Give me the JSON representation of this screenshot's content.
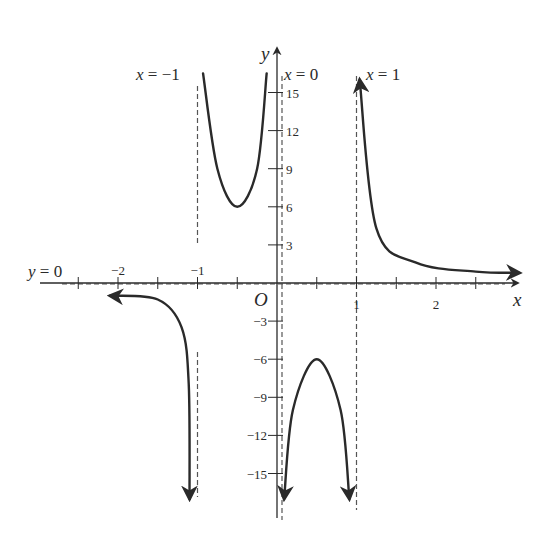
{
  "colors": {
    "background": "#ffffff",
    "ink": "#2a2a2a",
    "dashed": "#555555"
  },
  "chart_data": {
    "type": "line",
    "title": "",
    "xlabel": "x",
    "ylabel": "y",
    "origin_label": "O",
    "xlim": [
      -3.0,
      3.0
    ],
    "ylim": [
      -17,
      18
    ],
    "grid": false,
    "x_ticks": [
      -2.5,
      -2,
      -1.5,
      -1,
      -0.5,
      0.5,
      1,
      1.5,
      2,
      2.5
    ],
    "x_tick_labels": [
      {
        "value": -2,
        "label": "−2"
      },
      {
        "value": -1,
        "label": "−1"
      },
      {
        "value": 1,
        "label": "1"
      },
      {
        "value": 2,
        "label": "2"
      }
    ],
    "y_ticks": [
      15,
      12,
      9,
      6,
      3,
      -3,
      -6,
      -9,
      -12,
      -15
    ],
    "y_tick_labels": [
      {
        "value": 15,
        "label": "15"
      },
      {
        "value": 12,
        "label": "12"
      },
      {
        "value": 9,
        "label": "9"
      },
      {
        "value": 6,
        "label": "6"
      },
      {
        "value": 3,
        "label": "3"
      },
      {
        "value": -3,
        "label": "−3"
      },
      {
        "value": -6,
        "label": "−6"
      },
      {
        "value": -9,
        "label": "−9"
      },
      {
        "value": -12,
        "label": "−12"
      },
      {
        "value": -15,
        "label": "−15"
      }
    ],
    "asymptotes": [
      {
        "type": "vertical",
        "x": -1,
        "label_var": "x",
        "label_eq": " = −1"
      },
      {
        "type": "vertical",
        "x": 0,
        "label_var": "x",
        "label_eq": " = 0"
      },
      {
        "type": "vertical",
        "x": 1,
        "label_var": "x",
        "label_eq": " = 1"
      },
      {
        "type": "horizontal",
        "y": 0,
        "label_var": "y",
        "label_eq": " = 0"
      }
    ],
    "series": [
      {
        "name": "branch x < -1",
        "points": [
          [
            -2.1,
            -1.0
          ],
          [
            -1.5,
            -1.3
          ],
          [
            -1.2,
            -3.5
          ],
          [
            -1.11,
            -8
          ],
          [
            -1.1,
            -17
          ]
        ],
        "arrows": [
          "start",
          "end"
        ]
      },
      {
        "name": "branch -1 < x < 0",
        "points": [
          [
            -0.93,
            16.5
          ],
          [
            -0.75,
            9
          ],
          [
            -0.5,
            6
          ],
          [
            -0.25,
            9
          ],
          [
            -0.13,
            16.5
          ]
        ],
        "local_min": [
          -0.5,
          6
        ],
        "arrows": []
      },
      {
        "name": "branch 0 < x < 1",
        "points": [
          [
            0.09,
            -17
          ],
          [
            0.2,
            -10
          ],
          [
            0.5,
            -6
          ],
          [
            0.8,
            -10
          ],
          [
            0.91,
            -17
          ]
        ],
        "local_max": [
          0.5,
          -6
        ],
        "arrows": [
          "start",
          "end"
        ]
      },
      {
        "name": "branch x > 1",
        "points": [
          [
            1.04,
            16
          ],
          [
            1.25,
            4.3
          ],
          [
            1.75,
            1.6
          ],
          [
            2.5,
            0.9
          ],
          [
            3.05,
            0.8
          ]
        ],
        "arrows": [
          "start",
          "end"
        ]
      }
    ]
  }
}
